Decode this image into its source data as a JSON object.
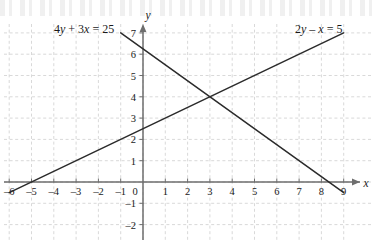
{
  "chart_data": {
    "type": "line",
    "title": "",
    "xlabel": "x",
    "ylabel": "y",
    "xlim": [
      -6,
      9
    ],
    "ylim": [
      -2,
      7
    ],
    "grid": true,
    "grid_step_x": 1,
    "grid_step_y": 1,
    "legend_position": "inline-endpoint-labels",
    "x_tick_labels": [
      "–6",
      "–5",
      "–4",
      "–3",
      "–2",
      "–1",
      "0",
      "1",
      "2",
      "3",
      "4",
      "5",
      "6",
      "7",
      "8",
      "9"
    ],
    "x_tick_values": [
      -6,
      -5,
      -4,
      -3,
      -2,
      -1,
      0,
      1,
      2,
      3,
      4,
      5,
      6,
      7,
      8,
      9
    ],
    "y_tick_labels": [
      "–2",
      "–1",
      "0",
      "1",
      "2",
      "3",
      "4",
      "5",
      "6",
      "7"
    ],
    "y_tick_values": [
      -2,
      -1,
      0,
      1,
      2,
      3,
      4,
      5,
      6,
      7
    ],
    "series": [
      {
        "name": "4y + 3x = 25",
        "equation": "4y + 3x = 25",
        "slope": -0.75,
        "intercept": 6.25,
        "x_start": -1,
        "y_start": 7,
        "x_end": 9,
        "y_end": -0.5,
        "label": "4y + 3x = 25",
        "label_x": -5.0,
        "label_y": 7.35
      },
      {
        "name": "2y – x = 5",
        "equation": "2y – x = 5",
        "slope": 0.5,
        "intercept": 2.5,
        "x_start": -6,
        "y_start": -0.5,
        "x_end": 9,
        "y_end": 7,
        "label": "2y – x = 5",
        "label_x": 6.7,
        "label_y": 7.35
      }
    ],
    "intersection": {
      "x": 3,
      "y": 4,
      "label": ""
    },
    "annotations": []
  },
  "axes": {
    "x_axis_name": "x",
    "y_axis_name": "y"
  }
}
